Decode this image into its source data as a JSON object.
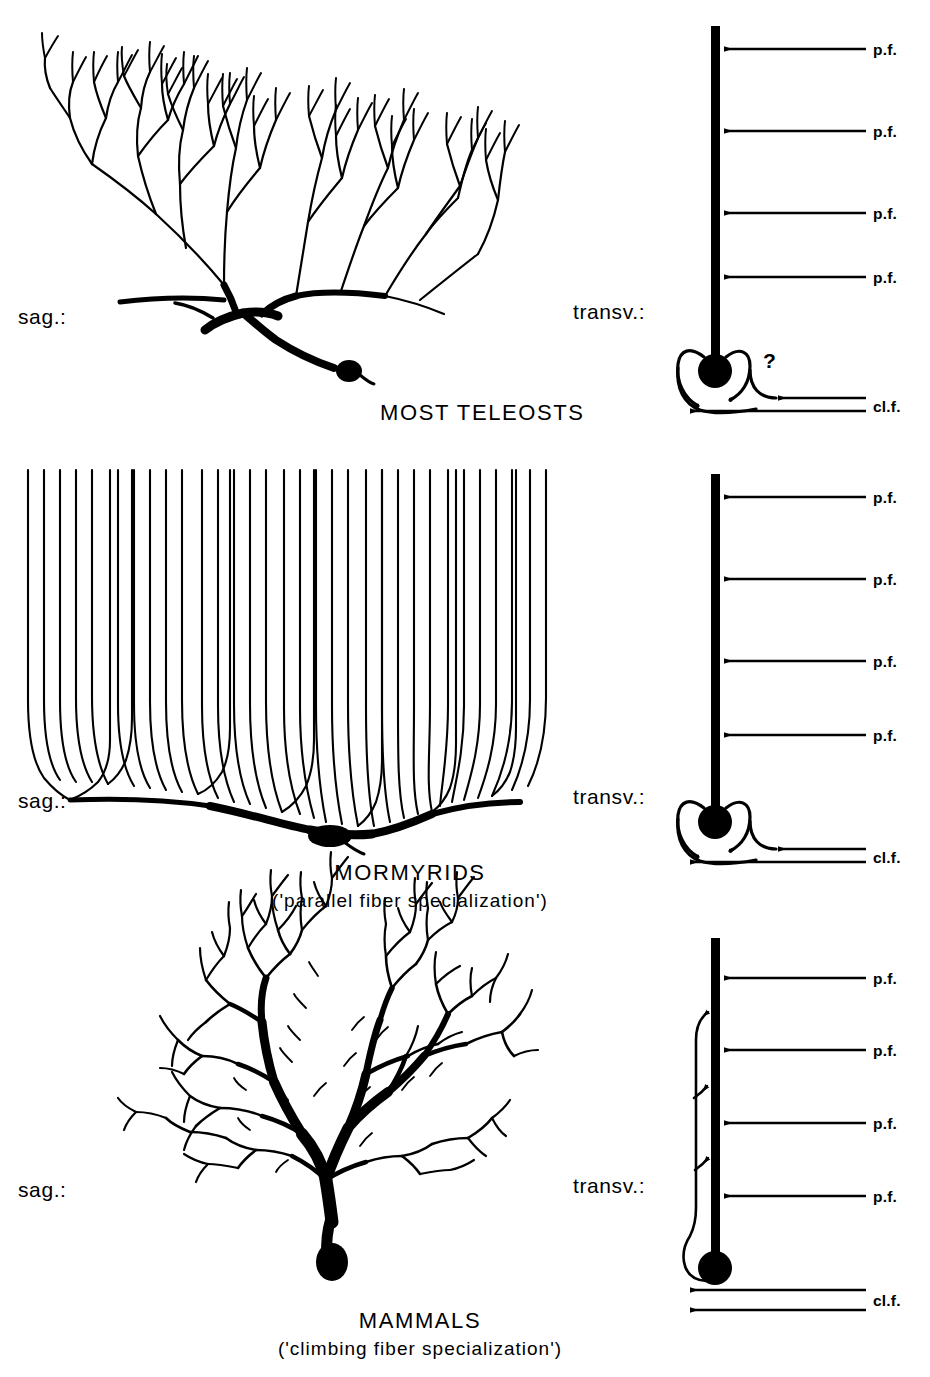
{
  "figure": {
    "background_color": "#ffffff",
    "ink_color": "#000000"
  },
  "panels": [
    {
      "id": "most-teleosts",
      "title": "MOST TELEOSTS",
      "subtitle": "",
      "sagittal_label": "sag.:",
      "transverse_label": "transv.:",
      "question_mark": "?",
      "parallel_fiber_labels": [
        "p.f.",
        "p.f.",
        "p.f.",
        "p.f."
      ],
      "climbing_fiber_label": "cl.f."
    },
    {
      "id": "mormyrids",
      "title": "MORMYRIDS",
      "subtitle": "('parallel fiber specialization')",
      "sagittal_label": "sag.:",
      "transverse_label": "transv.:",
      "question_mark": "",
      "parallel_fiber_labels": [
        "p.f.",
        "p.f.",
        "p.f.",
        "p.f."
      ],
      "climbing_fiber_label": "cl.f."
    },
    {
      "id": "mammals",
      "title": "MAMMALS",
      "subtitle": "('climbing fiber specialization')",
      "sagittal_label": "sag.:",
      "transverse_label": "transv.:",
      "question_mark": "",
      "parallel_fiber_labels": [
        "p.f.",
        "p.f.",
        "p.f.",
        "p.f."
      ],
      "climbing_fiber_label": "cl.f."
    }
  ]
}
